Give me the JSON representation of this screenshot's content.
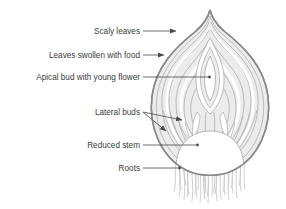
{
  "diagram": {
    "background_color": "#ffffff",
    "label_color": "#3b3b3b",
    "leader_color": "#4a4a4a",
    "outline_color": "#8a8a8a",
    "scale_fill": "#ececec",
    "scale_line_color": "#b4b4b4",
    "stem_fill": "#ffffff",
    "root_color": "#c9c9c9",
    "labels": [
      {
        "id": "scaly-leaves",
        "text": "Scaly leaves",
        "x": 140,
        "y": 34,
        "leader": {
          "x1": 143,
          "y1": 31,
          "x2": 180,
          "y2": 31
        },
        "arrow": true
      },
      {
        "id": "leaves-food",
        "text": "Leaves swollen with food",
        "x": 140,
        "y": 58,
        "leader": {
          "x1": 143,
          "y1": 55,
          "x2": 168,
          "y2": 55
        },
        "arrow": true
      },
      {
        "id": "apical-bud",
        "text": "Apical bud with young flower",
        "x": 140,
        "y": 80,
        "leader": {
          "x1": 143,
          "y1": 77,
          "x2": 209,
          "y2": 77
        },
        "arrow": false
      },
      {
        "id": "lateral-buds",
        "text": "Lateral buds",
        "x": 140,
        "y": 115,
        "leader": {
          "x1": 143,
          "y1": 112,
          "x2": 186,
          "y2": 112
        },
        "arrow": false
      },
      {
        "id": "reduced-stem",
        "text": "Reduced stem",
        "x": 140,
        "y": 148,
        "leader": {
          "x1": 143,
          "y1": 145,
          "x2": 199,
          "y2": 145
        },
        "arrow": false
      },
      {
        "id": "roots",
        "text": "Roots",
        "x": 140,
        "y": 171,
        "leader": {
          "x1": 143,
          "y1": 168,
          "x2": 181,
          "y2": 168
        },
        "arrow": false
      }
    ],
    "parts": [
      {
        "id": "outer-tunic",
        "name": "Scaly leaves (dry outer tunic)"
      },
      {
        "id": "fleshy-scales",
        "name": "Leaves swollen with food (fleshy scales)"
      },
      {
        "id": "apical-bud",
        "name": "Apical bud with young flower"
      },
      {
        "id": "lateral-buds",
        "name": "Lateral buds"
      },
      {
        "id": "reduced-stem",
        "name": "Reduced stem (basal plate)"
      },
      {
        "id": "roots",
        "name": "Adventitious roots"
      }
    ]
  }
}
